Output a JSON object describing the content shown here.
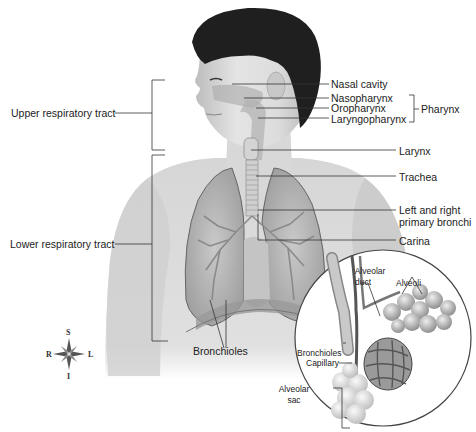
{
  "regions": {
    "upper": "Upper respiratory tract",
    "lower": "Lower respiratory tract"
  },
  "labels": {
    "nasal_cavity": "Nasal cavity",
    "nasopharynx": "Nasopharynx",
    "oropharynx": "Oropharynx",
    "laryngopharynx": "Laryngopharynx",
    "pharynx": "Pharynx",
    "larynx": "Larynx",
    "trachea": "Trachea",
    "bronchi_line1": "Left and right",
    "bronchi_line2": "primary bronchi",
    "carina": "Carina",
    "bronchioles": "Bronchioles"
  },
  "inset": {
    "alveolar_duct_line1": "Alveolar",
    "alveolar_duct_line2": "duct",
    "alveoli": "Alveoli",
    "bronchioles": "Bronchioles",
    "capillary": "Capillary",
    "alveolar_sac_line1": "Alveolar",
    "alveolar_sac_line2": "sac"
  },
  "compass": {
    "superior": "S",
    "inferior": "I",
    "right": "R",
    "left": "L"
  },
  "colors": {
    "skin": "#d9d9d9",
    "hair": "#1e1e1e",
    "lung": "#b8b8b8",
    "line": "#333333"
  }
}
